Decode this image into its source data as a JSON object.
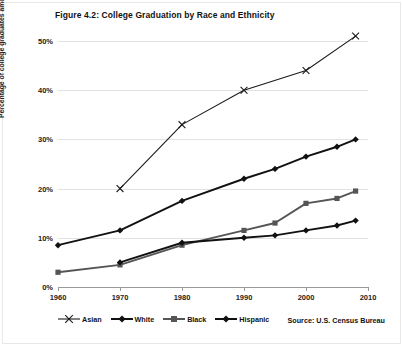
{
  "figure": {
    "title": "Figure 4.2: College Graduation by Race and Ethnicity",
    "source": "Source: U.S. Census Bureau"
  },
  "chart_data": {
    "type": "line",
    "title": "Figure 4.2: College Graduation by Race and Ethnicity",
    "xlabel": "",
    "ylabel": "Percentage of college graduates among adults",
    "xlim": [
      1960,
      2010
    ],
    "ylim": [
      0,
      50
    ],
    "grid": true,
    "legend_position": "bottom-left",
    "source": "Source: U.S. Census Bureau",
    "xticks": [
      1960,
      1970,
      1980,
      1990,
      2000,
      2010
    ],
    "xticklabels": [
      "1960",
      "1970",
      "1980",
      "1990",
      "2000",
      "2010"
    ],
    "yticks": [
      0,
      10,
      20,
      30,
      40,
      50
    ],
    "yticklabels": [
      "0%",
      "10%",
      "20%",
      "30%",
      "40%",
      "50%"
    ],
    "series": [
      {
        "name": "Asian",
        "marker": "x-cross",
        "color": "#1a1a1a",
        "x": [
          1970,
          1980,
          1990,
          2000,
          2008
        ],
        "values": [
          20,
          33,
          40,
          44,
          51
        ]
      },
      {
        "name": "White",
        "marker": "diamond",
        "color": "#111111",
        "x": [
          1960,
          1970,
          1980,
          1990,
          1995,
          2000,
          2005,
          2008
        ],
        "values": [
          8.5,
          11.5,
          17.5,
          22,
          24,
          26.5,
          28.5,
          30
        ]
      },
      {
        "name": "Black",
        "marker": "square",
        "color": "#555555",
        "x": [
          1960,
          1970,
          1980,
          1990,
          1995,
          2000,
          2005,
          2008
        ],
        "values": [
          3,
          4.5,
          8.5,
          11.5,
          13,
          17,
          18,
          19.5
        ]
      },
      {
        "name": "Hispanic",
        "marker": "diamond",
        "color": "#111111",
        "x": [
          1970,
          1980,
          1990,
          1995,
          2000,
          2005,
          2008
        ],
        "values": [
          5,
          9,
          10,
          10.5,
          11.5,
          12.5,
          13.5
        ]
      }
    ]
  }
}
